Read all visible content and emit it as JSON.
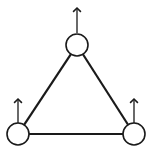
{
  "diagram": {
    "type": "triangle-graph",
    "stroke_color": "#1a1a1a",
    "background": "#ffffff",
    "nodes": [
      {
        "id": "top",
        "cx": 77,
        "cy": 45,
        "r": 11,
        "arrow": {
          "y1": 33,
          "y2": 8
        }
      },
      {
        "id": "bottom-left",
        "cx": 18,
        "cy": 134,
        "r": 11,
        "arrow": {
          "y1": 123,
          "y2": 99
        }
      },
      {
        "id": "bottom-right",
        "cx": 134,
        "cy": 134,
        "r": 11,
        "arrow": {
          "y1": 123,
          "y2": 99
        }
      }
    ],
    "edges": [
      {
        "from": "top",
        "to": "bottom-left"
      },
      {
        "from": "top",
        "to": "bottom-right"
      },
      {
        "from": "bottom-left",
        "to": "bottom-right"
      }
    ]
  }
}
